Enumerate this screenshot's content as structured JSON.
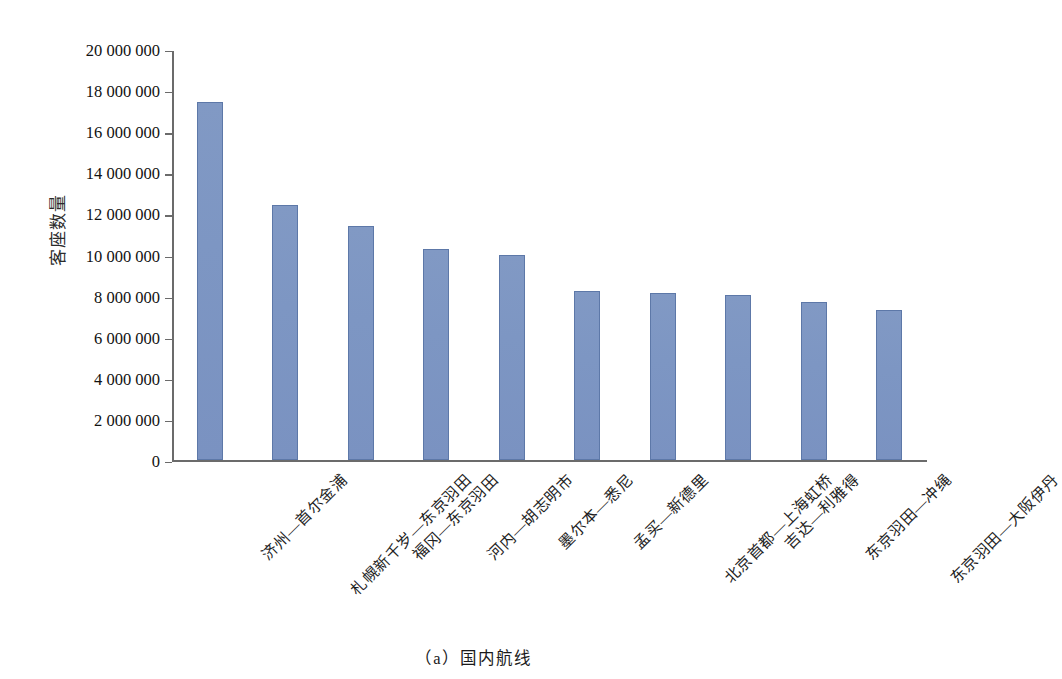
{
  "chart_data": {
    "type": "bar",
    "title": "",
    "caption": "（a）国内航线",
    "xlabel": "",
    "ylabel": "客座数量",
    "ylim": [
      0,
      20000000
    ],
    "ytick_step": 2000000,
    "ytick_labels": [
      "20 000 000",
      "18 000 000",
      "16 000 000",
      "14 000 000",
      "12 000 000",
      "10 000 000",
      "8 000 000",
      "6 000 000",
      "4 000 000",
      "2 000 000",
      "0"
    ],
    "ytick_values": [
      20000000,
      18000000,
      16000000,
      14000000,
      12000000,
      10000000,
      8000000,
      6000000,
      4000000,
      2000000,
      0
    ],
    "grid": false,
    "legend": false,
    "bar_color": "#7d96c3",
    "bar_edge_color": "#5d78a8",
    "axis_color": "#6b6b6b",
    "categories": [
      "济州—首尔金浦",
      "札幌新千岁—东京羽田",
      "福冈—东京羽田",
      "河内—胡志明市",
      "墨尔本—悉尼",
      "孟买—新德里",
      "北京首都—上海虹桥",
      "吉达—利雅得",
      "东京羽田—冲绳",
      "东京羽田—大阪伊丹"
    ],
    "values": [
      17450000,
      12450000,
      11400000,
      10300000,
      10000000,
      8250000,
      8150000,
      8050000,
      7700000,
      7300000
    ]
  }
}
